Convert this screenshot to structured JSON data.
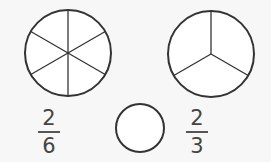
{
  "diagram": {
    "circles": [
      {
        "name": "circle-sixths",
        "parts": 6
      },
      {
        "name": "circle-thirds",
        "parts": 3
      }
    ],
    "left_fraction": {
      "numerator": "2",
      "denominator": "6"
    },
    "right_fraction": {
      "numerator": "2",
      "denominator": "3"
    },
    "comparison_answer": "",
    "colors": {
      "stroke": "#333333",
      "fill": "#ffffff",
      "text": "#444444",
      "background": "#f7f7f7"
    }
  }
}
